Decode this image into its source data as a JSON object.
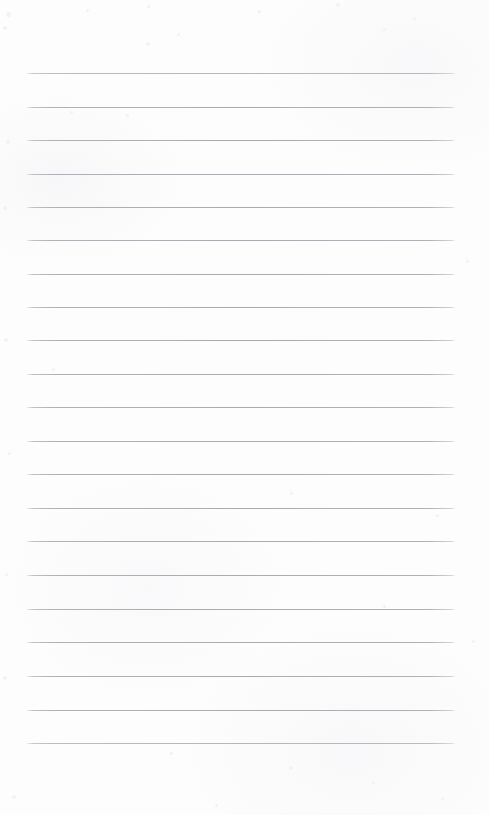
{
  "page": {
    "kind": "blank-lined-paper-scan",
    "width": 489,
    "height": 815,
    "background_color": "#fdfdfd",
    "text_content": "",
    "has_handwriting": false,
    "has_printed_text": false,
    "has_margin_rule": false
  },
  "rules": {
    "count": 21,
    "color": "#b4b4b8",
    "thickness_px": 1,
    "left_x": 27,
    "right_x": 455,
    "spacing_px": 33.5,
    "first_y": 73,
    "last_y": 743,
    "y_positions": [
      73,
      106.5,
      140,
      173.5,
      206.5,
      240,
      273.5,
      306.5,
      340,
      374,
      407,
      440.5,
      474,
      507.5,
      541,
      574.5,
      608.5,
      642,
      676,
      709.5,
      743
    ],
    "faint_indices": [
      0,
      20
    ]
  },
  "margins": {
    "top_blank_px": 73,
    "bottom_blank_px": 72,
    "left_px": 27,
    "right_px": 34
  },
  "speckles": [
    {
      "x": 6,
      "y": 12,
      "size": 5
    },
    {
      "x": 3,
      "y": 26,
      "size": 4
    },
    {
      "x": 86,
      "y": 9,
      "size": 3
    },
    {
      "x": 147,
      "y": 5,
      "size": 3
    },
    {
      "x": 177,
      "y": 33,
      "size": 3
    },
    {
      "x": 146,
      "y": 42,
      "size": 4
    },
    {
      "x": 258,
      "y": 10,
      "size": 3
    },
    {
      "x": 336,
      "y": 3,
      "size": 4
    },
    {
      "x": 383,
      "y": 28,
      "size": 3
    },
    {
      "x": 413,
      "y": 17,
      "size": 3
    },
    {
      "x": 6,
      "y": 140,
      "size": 4
    },
    {
      "x": 3,
      "y": 206,
      "size": 4
    },
    {
      "x": 4,
      "y": 338,
      "size": 4
    },
    {
      "x": 8,
      "y": 452,
      "size": 3
    },
    {
      "x": 5,
      "y": 573,
      "size": 3
    },
    {
      "x": 3,
      "y": 676,
      "size": 4
    },
    {
      "x": 70,
      "y": 111,
      "size": 3
    },
    {
      "x": 126,
      "y": 114,
      "size": 3
    },
    {
      "x": 52,
      "y": 368,
      "size": 3
    },
    {
      "x": 290,
      "y": 492,
      "size": 3
    },
    {
      "x": 436,
      "y": 514,
      "size": 3
    },
    {
      "x": 383,
      "y": 605,
      "size": 3
    },
    {
      "x": 170,
      "y": 752,
      "size": 3
    },
    {
      "x": 289,
      "y": 766,
      "size": 4
    },
    {
      "x": 372,
      "y": 781,
      "size": 3
    },
    {
      "x": 441,
      "y": 797,
      "size": 3
    },
    {
      "x": 215,
      "y": 804,
      "size": 3
    },
    {
      "x": 12,
      "y": 795,
      "size": 4
    },
    {
      "x": 466,
      "y": 260,
      "size": 3
    },
    {
      "x": 472,
      "y": 640,
      "size": 3
    }
  ]
}
